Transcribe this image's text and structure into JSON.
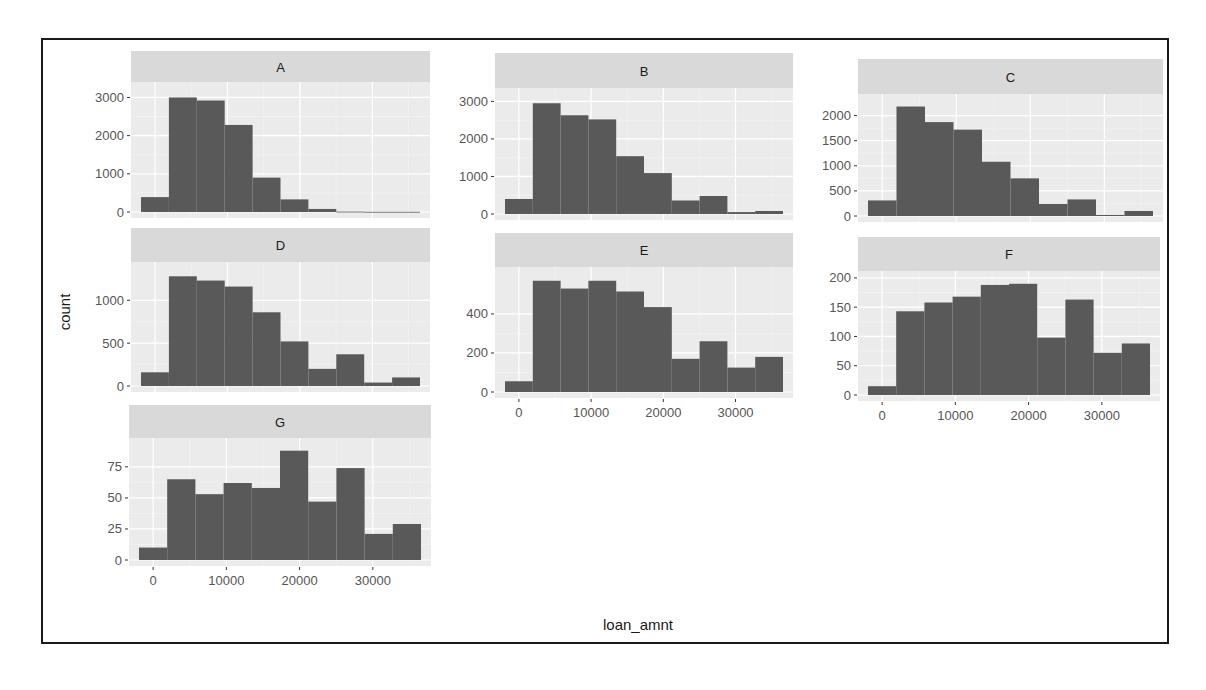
{
  "chart_data": {
    "type": "bar",
    "subtype": "faceted-histogram",
    "title": "",
    "xlabel": "loan_amnt",
    "ylabel": "count",
    "facet_by": "grade",
    "scales": "free_y",
    "ncol": 3,
    "xlim": [
      -1925,
      36575
    ],
    "bin_width": 3850,
    "bin_centers": [
      0,
      3850,
      7700,
      11550,
      15400,
      19250,
      23100,
      26950,
      30800,
      34650
    ],
    "x_ticks": [
      0,
      10000,
      20000,
      30000
    ],
    "x_tick_labels": [
      "0",
      "10000",
      "20000",
      "30000"
    ],
    "grid": true,
    "panel_background": "#ebebeb",
    "strip_background": "#d9d9d9",
    "bar_color": "#595959",
    "facets": [
      {
        "label": "A",
        "ylim": [
          0,
          3300
        ],
        "y_ticks": [
          0,
          1000,
          2000,
          3000
        ],
        "y_tick_labels": [
          "0",
          "1000",
          "2000",
          "3000"
        ],
        "values": [
          390,
          3000,
          2920,
          2280,
          900,
          330,
          80,
          10,
          5,
          5
        ]
      },
      {
        "label": "B",
        "ylim": [
          0,
          3250
        ],
        "y_ticks": [
          0,
          1000,
          2000,
          3000
        ],
        "y_tick_labels": [
          "0",
          "1000",
          "2000",
          "3000"
        ],
        "values": [
          400,
          2950,
          2630,
          2520,
          1540,
          1090,
          360,
          480,
          50,
          80
        ]
      },
      {
        "label": "C",
        "ylim": [
          0,
          2350
        ],
        "y_ticks": [
          0,
          500,
          1000,
          1500,
          2000
        ],
        "y_tick_labels": [
          "0",
          "500",
          "1000",
          "1500",
          "2000"
        ],
        "values": [
          310,
          2180,
          1870,
          1720,
          1080,
          750,
          240,
          330,
          20,
          100
        ]
      },
      {
        "label": "D",
        "ylim": [
          0,
          1400
        ],
        "y_ticks": [
          0,
          500,
          1000
        ],
        "y_tick_labels": [
          "0",
          "500",
          "1000"
        ],
        "values": [
          160,
          1280,
          1230,
          1160,
          860,
          520,
          200,
          370,
          40,
          100
        ]
      },
      {
        "label": "E",
        "ylim": [
          0,
          620
        ],
        "y_ticks": [
          0,
          200,
          400
        ],
        "y_tick_labels": [
          "0",
          "200",
          "400"
        ],
        "values": [
          55,
          570,
          530,
          570,
          515,
          435,
          170,
          260,
          125,
          180
        ]
      },
      {
        "label": "F",
        "ylim": [
          0,
          205
        ],
        "y_ticks": [
          0,
          50,
          100,
          150,
          200
        ],
        "y_tick_labels": [
          "0",
          "50",
          "100",
          "150",
          "200"
        ],
        "values": [
          15,
          143,
          158,
          168,
          188,
          190,
          98,
          163,
          72,
          88
        ]
      },
      {
        "label": "G",
        "ylim": [
          0,
          95
        ],
        "y_ticks": [
          0,
          25,
          50,
          75
        ],
        "y_tick_labels": [
          "0",
          "25",
          "50",
          "75"
        ],
        "values": [
          10,
          65,
          53,
          62,
          58,
          88,
          47,
          74,
          21,
          29
        ]
      }
    ]
  },
  "layout_text": {
    "x_axis_title": "loan_amnt",
    "y_axis_title": "count"
  }
}
